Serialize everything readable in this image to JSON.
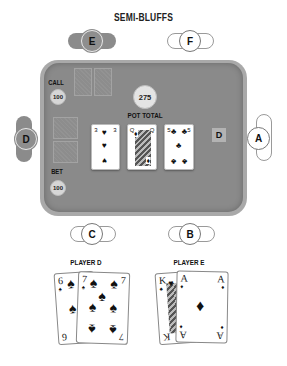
{
  "title": "SEMI-BLUFFS",
  "seats": {
    "E": {
      "label": "E",
      "style": "filled"
    },
    "F": {
      "label": "F",
      "style": "outline"
    },
    "D": {
      "label": "D",
      "style": "filled"
    },
    "A": {
      "label": "A",
      "style": "outline"
    },
    "C": {
      "label": "C",
      "style": "outline"
    },
    "B": {
      "label": "B",
      "style": "outline"
    }
  },
  "table": {
    "call_label": "CALL",
    "call_amount": "100",
    "bet_label": "BET",
    "bet_amount": "100",
    "pot_amount": "275",
    "pot_label": "POT TOTAL",
    "dealer_button": "D",
    "board": [
      {
        "rank": "3",
        "suit": "♥",
        "suit_name": "hearts"
      },
      {
        "rank": "Q",
        "suit": "♦",
        "suit_name": "diamonds"
      },
      {
        "rank": "5",
        "suit": "♣",
        "suit_name": "clubs"
      }
    ]
  },
  "hands": {
    "player_d": {
      "label": "PLAYER D",
      "cards": [
        {
          "rank": "6",
          "suit": "♠"
        },
        {
          "rank": "7",
          "suit": "♠"
        }
      ]
    },
    "player_e": {
      "label": "PLAYER E",
      "cards": [
        {
          "rank": "K",
          "suit": "♠"
        },
        {
          "rank": "A",
          "suit": "♦"
        }
      ]
    }
  },
  "colors": {
    "felt": "#8a8a8a",
    "rail": "#a9a9a9",
    "seat_filled": "#8e8e8e",
    "chip": "#d6d6d6"
  }
}
